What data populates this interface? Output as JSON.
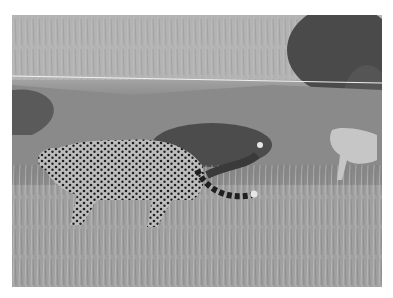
{
  "image": {
    "description": "Black and white photograph of a cheetah walking through tall savanna grass, with a cub visible at the right edge near bushes",
    "subjects": [
      "adult cheetah",
      "cheetah cub"
    ],
    "palette": {
      "light": "#c4c4c4",
      "mid": "#8c8c8c",
      "dark": "#3a3a3a",
      "background": "#ffffff"
    }
  }
}
